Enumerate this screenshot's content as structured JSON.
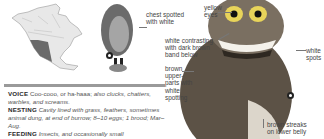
{
  "range_map": {
    "region": "North America"
  },
  "annotations": {
    "chest": "chest spotted\nwith white",
    "eyes": "yellow\neyes",
    "band": "white contrasting\nwith dark brown\nband below",
    "spots": "white\nspots",
    "upperparts": "brown\nupper-\nparts with\nwhite\nspotting",
    "belly": "brown streaks\non lower belly"
  },
  "text": {
    "voice_label": "VOICE",
    "voice_normal": "Coo-cooo, or ha-haaa;",
    "voice_italic": "also clucks, chatters, warbles, and screams.",
    "nesting_label": "NESTING",
    "nesting_text": "Cavity lined with grass, feathers, sometimes animal dung, at end of burrow; 8–10 eggs; 1 brood; Mar–Aug.",
    "feeding_label": "FEEDING",
    "feeding_text": "Insects, and occasionally small"
  },
  "symbols": [
    "female-symbol",
    "female-symbol"
  ]
}
